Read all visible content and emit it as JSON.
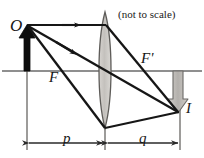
{
  "figure": {
    "kind": "optics-ray-diagram",
    "note": "(not to scale)",
    "labels": {
      "object": "O",
      "image": "I",
      "focal_near": "F",
      "focal_far": "F'",
      "object_distance": "p",
      "image_distance": "q"
    },
    "colors": {
      "ink": "#161616",
      "axis": "#6a6a6a",
      "lens_fill": "#c9c6c2",
      "lens_stroke": "#5e5c59",
      "image_arrow_fill": "#b9b6b2",
      "image_arrow_stroke": "#6b6966",
      "object_arrow": "#0d0d0d",
      "background": "#ffffff"
    },
    "geometry": {
      "optical_axis_y": 71,
      "lens_center_x": 105,
      "lens_top_y": 12,
      "lens_bottom_y": 128,
      "object_x": 27,
      "object_tip_y": 25,
      "image_x": 178,
      "image_tip_y": 112,
      "focal_near_x": 62,
      "focal_far_x": 148,
      "dimension_line_y": 143
    },
    "rays": [
      {
        "name": "parallel-ray",
        "points": "27,25 105,25 178,112"
      },
      {
        "name": "chief-ray-through-center",
        "points": "27,25 178,112"
      },
      {
        "name": "focal-ray-through-F",
        "points": "27,25 105,128 178,112"
      }
    ]
  }
}
